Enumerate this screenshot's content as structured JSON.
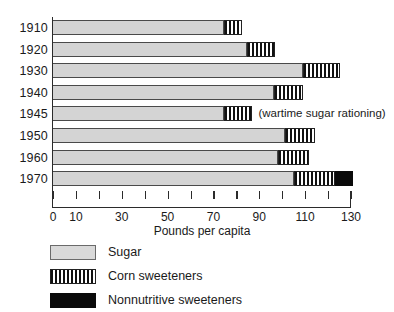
{
  "chart_data": {
    "type": "bar",
    "orientation": "horizontal",
    "stacked": true,
    "title": "",
    "xlabel": "Pounds per capita",
    "ylabel": "",
    "xlim": [
      0,
      130
    ],
    "grid": false,
    "legend_position": "below",
    "categories": [
      "1910",
      "1920",
      "1930",
      "1940",
      "1945",
      "1950",
      "1960",
      "1970"
    ],
    "tick_values": [
      0,
      10,
      20,
      30,
      40,
      50,
      60,
      70,
      80,
      90,
      100,
      110,
      120,
      130
    ],
    "tick_labels": [
      "0",
      "10",
      "",
      "30",
      "",
      "50",
      "",
      "70",
      "",
      "90",
      "",
      "110",
      "",
      "130"
    ],
    "series": [
      {
        "name": "Sugar",
        "color": "#d4d4d4",
        "values": [
          74.5,
          84.5,
          109,
          96.5,
          74.5,
          101,
          98,
          105
        ]
      },
      {
        "name": "Corn sweeteners",
        "color": "#111111",
        "pattern": "vertical-stripes",
        "values": [
          8,
          12.5,
          16,
          12.5,
          12.5,
          13.5,
          13.5,
          18
        ]
      },
      {
        "name": "Nonnutritive sweeteners",
        "color": "#0a0a0a",
        "values": [
          0,
          0,
          0,
          0,
          0,
          0,
          0,
          8
        ]
      }
    ],
    "totals": [
      82.5,
      97,
      125,
      109,
      87,
      114.5,
      111.5,
      131
    ],
    "annotations": [
      {
        "category": "1945",
        "text": "(wartime sugar rationing)"
      }
    ]
  },
  "legend": {
    "items": [
      {
        "label": "Sugar",
        "swatch": "light-gray-fill"
      },
      {
        "label": "Corn sweeteners",
        "swatch": "vertical-stripe-fill"
      },
      {
        "label": "Nonnutritive sweeteners",
        "swatch": "solid-black-fill"
      }
    ]
  }
}
